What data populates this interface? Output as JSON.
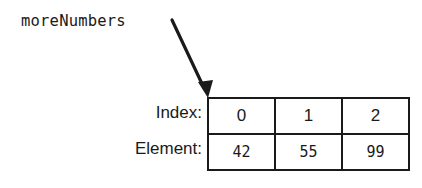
{
  "figure": {
    "pointer_label": "moreNumbers",
    "arrow": {
      "name": "pointer-arrow",
      "description": "arrow from variable name to first array cell"
    },
    "row_labels": {
      "index": "Index:",
      "element": "Element:"
    },
    "table": {
      "indices": [
        "0",
        "1",
        "2"
      ],
      "elements": [
        "42",
        "55",
        "99"
      ]
    },
    "colors": {
      "ink": "#1a1a1a",
      "background": "#ffffff"
    }
  }
}
